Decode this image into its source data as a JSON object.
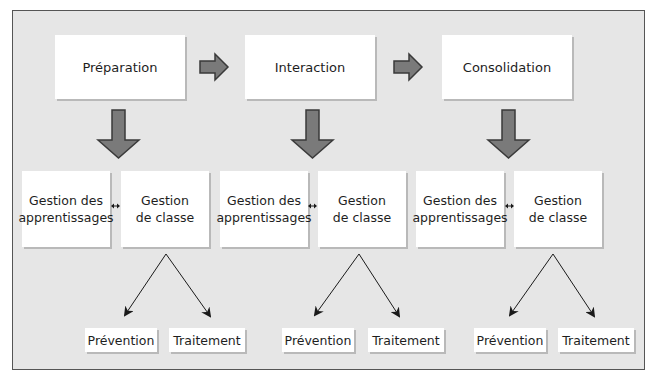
{
  "phases": [
    {
      "label": "Préparation"
    },
    {
      "label": "Interaction"
    },
    {
      "label": "Consolidation"
    }
  ],
  "management": [
    {
      "apprentissages": "Gestion des\napprentissages",
      "classe": "Gestion\nde classe"
    },
    {
      "apprentissages": "Gestion des\napprentissages",
      "classe": "Gestion\nde classe"
    },
    {
      "apprentissages": "Gestion des\napprentissages",
      "classe": "Gestion\nde classe"
    }
  ],
  "outcomes": [
    {
      "prevention": "Prévention",
      "traitement": "Traitement"
    },
    {
      "prevention": "Prévention",
      "traitement": "Traitement"
    },
    {
      "prevention": "Prévention",
      "traitement": "Traitement"
    }
  ],
  "colors": {
    "background": "#e6e6e6",
    "box": "#ffffff",
    "arrow_fill": "#7a7a7a",
    "arrow_stroke": "#3a3a3a"
  }
}
